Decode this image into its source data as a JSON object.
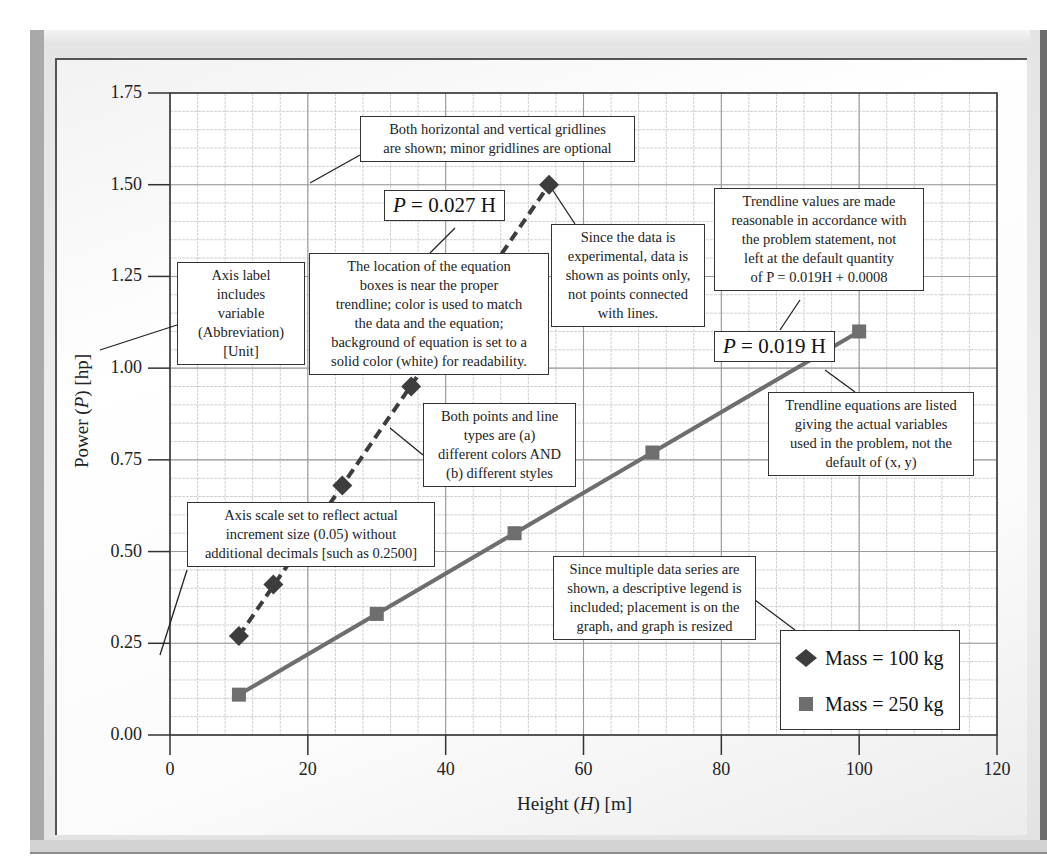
{
  "chart_data": {
    "type": "scatter",
    "title": "",
    "xlabel": "Height (H) [m]",
    "ylabel": "Power (P) [hp]",
    "xlim": [
      0,
      120
    ],
    "ylim": [
      0,
      1.75
    ],
    "x_ticks": [
      "0",
      "20",
      "40",
      "60",
      "80",
      "100",
      "120"
    ],
    "y_ticks": [
      "0.00",
      "0.25",
      "0.50",
      "0.75",
      "1.00",
      "1.25",
      "1.50",
      "1.75"
    ],
    "grid": {
      "major": true,
      "minor": true
    },
    "legend_position": "lower right (inside plot)",
    "series": [
      {
        "name": "Mass = 100 kg",
        "marker": "diamond",
        "color": "#3d3d3d",
        "trendline": {
          "style": "dashed",
          "equation": "P = 0.027 H",
          "slope": 0.027
        },
        "points": [
          [
            10,
            0.27
          ],
          [
            15,
            0.41
          ],
          [
            25,
            0.68
          ],
          [
            35,
            0.95
          ],
          [
            55,
            1.5
          ]
        ]
      },
      {
        "name": "Mass = 250 kg",
        "marker": "square",
        "color": "#6e6e6e",
        "trendline": {
          "style": "solid",
          "equation": "P = 0.019 H",
          "slope": 0.019
        },
        "points": [
          [
            10,
            0.11
          ],
          [
            30,
            0.33
          ],
          [
            50,
            0.55
          ],
          [
            70,
            0.77
          ],
          [
            100,
            1.1
          ]
        ]
      }
    ],
    "annotations": [
      "Both horizontal and vertical gridlines are shown; minor gridlines are optional",
      "Axis label includes variable (Abbreviation) [Unit]",
      "The location of the equation boxes is near the proper trendline; color is used to match the data and the equation; background of equation is set to a solid color (white) for readability.",
      "Since the data is experimental, data is shown as points only, not points connected with lines.",
      "Trendline values are made reasonable in accordance with the problem statement, not left at the default quantity of P = 0.019H + 0.0008",
      "Trendline equations are listed giving the actual variables used in the problem, not the default of (x, y)",
      "Both points and line types are (a) different colors AND (b) different styles",
      "Axis scale set to reflect actual increment size (0.05) without additional decimals [such as 0.2500]",
      "Since multiple data series are shown, a descriptive legend is included; placement is on the graph, and graph is resized"
    ]
  },
  "axes": {
    "x_title_prefix": "Height (",
    "x_title_var": "H",
    "x_title_suffix": ") [m]",
    "y_title_prefix": "Power (",
    "y_title_var": "P",
    "y_title_suffix": ") [hp]"
  },
  "equations": {
    "eq100_var": "P",
    "eq100_rest": " = 0.027 H",
    "eq250_var": "P",
    "eq250_rest": " = 0.019 H"
  },
  "callouts": {
    "gridlines": [
      "Both horizontal and vertical gridlines",
      "are shown; minor gridlines are optional"
    ],
    "axis_label": [
      "Axis label",
      "includes",
      "variable",
      "(Abbreviation)",
      "[Unit]"
    ],
    "eq_location": [
      "The location of the equation",
      "boxes is near the proper",
      "trendline; color is used to match",
      "the data and the equation;",
      "background of equation is set to a",
      "solid color (white) for readability."
    ],
    "experimental": [
      "Since the data is",
      "experimental, data is",
      "shown as points only,",
      "not points connected",
      "with lines."
    ],
    "trend_values": [
      "Trendline values are made",
      "reasonable in accordance with",
      "the problem statement, not",
      "left at the default quantity",
      "of P = 0.019H + 0.0008"
    ],
    "trend_vars": [
      "Trendline equations are listed",
      "giving the actual variables",
      "used in the problem, not the",
      "default of (x, y)"
    ],
    "styles": [
      "Both points and line",
      "types are (a)",
      "different colors AND",
      "(b) different styles"
    ],
    "scale": [
      "Axis scale set to reflect actual",
      "increment size (0.05) without",
      "additional decimals [such as 0.2500]"
    ],
    "legend_note": [
      "Since multiple data series are",
      "shown, a descriptive legend is",
      "included; placement is on the",
      "graph, and graph is resized"
    ]
  },
  "legend": {
    "items": [
      {
        "label": "Mass = 100 kg",
        "icon": "diamond-icon"
      },
      {
        "label": "Mass = 250 kg",
        "icon": "square-icon"
      }
    ]
  },
  "colors": {
    "series100": "#3d3d3d",
    "series250": "#6e6e6e",
    "grid_major": "#9a9a9a",
    "grid_minor": "#d0d0d0",
    "axis": "#333333"
  }
}
